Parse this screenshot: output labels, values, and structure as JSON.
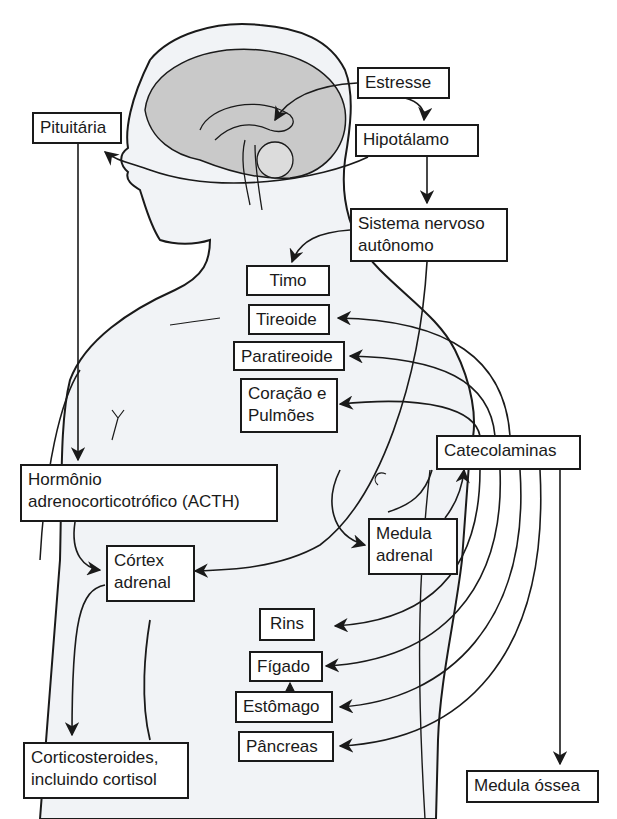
{
  "diagram": {
    "type": "stress-response pathway illustration",
    "nodes": {
      "estresse": "Estresse",
      "hipotalamo": "Hipotálamo",
      "pituitaria": "Pituitária",
      "sna": {
        "line1": "Sistema nervoso",
        "line2": "autônomo"
      },
      "timo": "Timo",
      "tireoide": "Tireoide",
      "paratireoide": "Paratireoide",
      "coracao": {
        "line1": "Coração e",
        "line2": "Pulmões"
      },
      "catecolaminas": "Catecolaminas",
      "acth": {
        "line1": "Hormônio",
        "line2": "adrenocorticotrófico (ACTH)"
      },
      "medula_adrenal": {
        "line1": "Medula",
        "line2": "adrenal"
      },
      "cortex_adrenal": {
        "line1": "Córtex",
        "line2": "adrenal"
      },
      "rins": "Rins",
      "figado": "Fígado",
      "estomago": "Estômago",
      "pancreas": "Pâncreas",
      "corticosteroides": {
        "line1": "Corticosteroides,",
        "line2": "incluindo cortisol"
      },
      "medula_ossea": "Medula óssea"
    },
    "edges": [
      [
        "Estresse",
        "Hipotálamo"
      ],
      [
        "Hipotálamo",
        "Pituitária"
      ],
      [
        "Hipotálamo",
        "Sistema nervoso autônomo"
      ],
      [
        "Sistema nervoso autônomo",
        "Timo"
      ],
      [
        "Sistema nervoso autônomo",
        "Córtex adrenal"
      ],
      [
        "Sistema nervoso autônomo",
        "Medula adrenal"
      ],
      [
        "Pituitária",
        "Hormônio adrenocorticotrófico (ACTH)"
      ],
      [
        "Hormônio adrenocorticotrófico (ACTH)",
        "Córtex adrenal"
      ],
      [
        "Córtex adrenal",
        "Corticosteroides, incluindo cortisol"
      ],
      [
        "Medula adrenal",
        "Catecolaminas"
      ],
      [
        "Catecolaminas",
        "Tireoide"
      ],
      [
        "Catecolaminas",
        "Paratireoide"
      ],
      [
        "Catecolaminas",
        "Coração e Pulmões"
      ],
      [
        "Catecolaminas",
        "Rins"
      ],
      [
        "Catecolaminas",
        "Fígado"
      ],
      [
        "Catecolaminas",
        "Estômago"
      ],
      [
        "Catecolaminas",
        "Pâncreas"
      ],
      [
        "Catecolaminas",
        "Medula óssea"
      ]
    ],
    "colors": {
      "line": "#1a1a1a",
      "body_fill": "#f1f3f6",
      "brain_fill": "#c9c9c9",
      "box_fill": "#ffffff"
    }
  }
}
